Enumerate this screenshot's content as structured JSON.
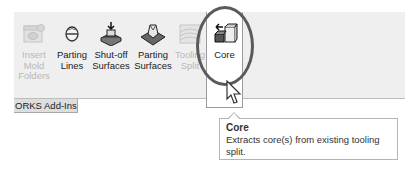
{
  "ribbon": {
    "buttons": [
      {
        "label_lines": [
          "Insert",
          "Mold",
          "Folders"
        ],
        "icon": "insert-mold-folders-icon",
        "enabled": false
      },
      {
        "label_lines": [
          "Parting",
          "Lines"
        ],
        "icon": "parting-lines-icon",
        "enabled": true
      },
      {
        "label_lines": [
          "Shut-off",
          "Surfaces"
        ],
        "icon": "shut-off-surfaces-icon",
        "enabled": true
      },
      {
        "label_lines": [
          "Parting",
          "Surfaces"
        ],
        "icon": "parting-surfaces-icon",
        "enabled": true
      },
      {
        "label_lines": [
          "Tooling",
          "Split"
        ],
        "icon": "tooling-split-icon",
        "enabled": false
      },
      {
        "label_lines": [
          "Core"
        ],
        "icon": "core-icon",
        "enabled": true,
        "highlighted": true
      }
    ]
  },
  "tabs": [
    {
      "label": "ORKS Add-Ins"
    }
  ],
  "tooltip": {
    "title": "Core",
    "description_line1": "Extracts core(s) from existing tooling",
    "description_line2": "split."
  },
  "colors": {
    "ribbon_bg": "#efefef",
    "highlight_ellipse": "#5a5a5a",
    "disabled_text": "#b8b8b8"
  }
}
